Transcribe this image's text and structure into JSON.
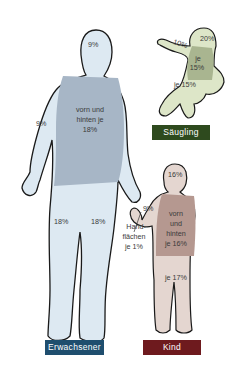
{
  "adult": {
    "label": "Erwachsener",
    "color": "#1f4e6e",
    "fill": "#dde9f2",
    "torso_fill": "#a7b6c6",
    "head": "9%",
    "arm": "9%",
    "torso_l1": "vorn und",
    "torso_l2": "hinten je",
    "torso_l3": "18%",
    "leg_left": "18%",
    "leg_right": "18%"
  },
  "palm": {
    "l1": "Hand-",
    "l2": "flächen",
    "l3": "je 1%"
  },
  "infant": {
    "label": "Säugling",
    "color": "#2e4a1e",
    "fill": "#dde6c8",
    "torso_fill": "#a9b590",
    "head": "20%",
    "arm": "10%",
    "torso_l1": "je",
    "torso_l2": "15%",
    "legs": "je 15%"
  },
  "child": {
    "label": "Kind",
    "color": "#6e1a1e",
    "fill": "#e4d6d0",
    "torso_fill": "#b59890",
    "head": "16%",
    "arm": "9%",
    "torso_l1": "vorn",
    "torso_l2": "und",
    "torso_l3": "hinten",
    "torso_l4": "je 16%",
    "legs": "je 17%"
  }
}
